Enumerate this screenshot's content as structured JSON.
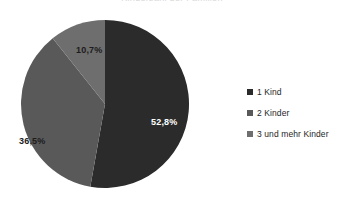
{
  "title_remnant": "Kinderzahl der Familien",
  "chart_data": {
    "type": "pie",
    "title": "",
    "categories": [
      "1 Kind",
      "2 Kinder",
      "3 und mehr Kinder"
    ],
    "values": [
      52.8,
      36.5,
      10.7
    ],
    "value_labels": [
      "52,8%",
      "36,5%",
      "10,7%"
    ],
    "unit": "%",
    "colors": [
      "#2b2b2b",
      "#595959",
      "#6e6e6e"
    ],
    "label_text_colors": [
      "#ffffff",
      "#1c1c1c",
      "#1c1c1c"
    ],
    "start_angle_deg": 0,
    "direction": "clockwise",
    "legend_position": "right",
    "grid": false,
    "series": [
      {
        "name": "Familien nach Kinderzahl",
        "values": [
          52.8,
          36.5,
          10.7
        ]
      }
    ]
  },
  "legend": {
    "items": [
      {
        "label": "1 Kind",
        "color": "#2b2b2b"
      },
      {
        "label": "2 Kinder",
        "color": "#595959"
      },
      {
        "label": "3 und mehr Kinder",
        "color": "#6e6e6e"
      }
    ]
  },
  "labels": {
    "slice_1": "52,8%",
    "slice_2": "36,5%",
    "slice_3": "10,7%"
  }
}
